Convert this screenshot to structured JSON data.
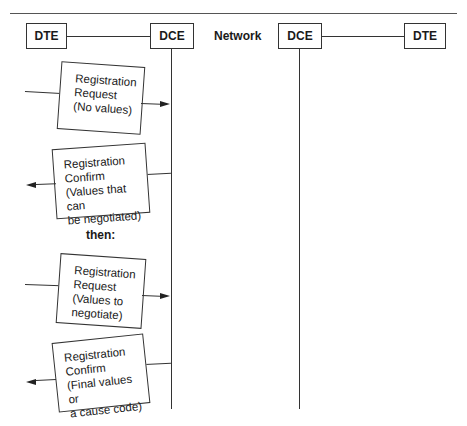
{
  "header": {
    "left_dte": "DTE",
    "left_dce": "DCE",
    "network": "Network",
    "right_dce": "DCE",
    "right_dte": "DTE"
  },
  "messages": [
    {
      "lines": [
        "Registration",
        "Request",
        "(No values)"
      ],
      "direction": "to-dce"
    },
    {
      "lines": [
        "Registration",
        "Confirm",
        "(Values that can",
        "be negotiated)"
      ],
      "direction": "to-dte"
    },
    {
      "lines": [
        "Registration",
        "Request",
        "(Values to",
        "negotiate)"
      ],
      "direction": "to-dce"
    },
    {
      "lines": [
        "Registration",
        "Confirm",
        "(Final values or",
        "a cause code)"
      ],
      "direction": "to-dte"
    }
  ],
  "separator": "then:"
}
